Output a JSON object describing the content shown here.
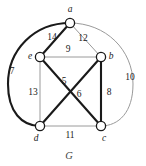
{
  "figure": {
    "caption": "G",
    "caption_position": {
      "x": 69,
      "y": 159
    },
    "background_color": "#ffffff"
  },
  "colors": {
    "thick_edge": "#1a1a1a",
    "thin_edge": "#9a9a9a",
    "node_stroke": "#1a1a1a",
    "node_fill": "#ffffff",
    "text": "#1a1a1a",
    "caption": "#444444"
  },
  "chart_data": {
    "type": "diagram",
    "subtype": "weighted-undirected-graph",
    "title": "G",
    "nodes": [
      {
        "id": "a",
        "label": "a",
        "x": 70,
        "y": 23,
        "label_x": 70,
        "label_y": 12
      },
      {
        "id": "b",
        "label": "b",
        "x": 101,
        "y": 57,
        "label_x": 111,
        "label_y": 59
      },
      {
        "id": "c",
        "label": "c",
        "x": 101,
        "y": 126,
        "label_x": 104,
        "label_y": 141
      },
      {
        "id": "d",
        "label": "d",
        "x": 40,
        "y": 126,
        "label_x": 36,
        "label_y": 141
      },
      {
        "id": "e",
        "label": "e",
        "x": 40,
        "y": 57,
        "label_x": 30,
        "label_y": 59
      }
    ],
    "edges": [
      {
        "id": "edge-a-e",
        "source": "a",
        "target": "e",
        "weight": 14,
        "weight_label": "14",
        "style": "thick",
        "shape": "line",
        "label_x": 52,
        "label_y": 40
      },
      {
        "id": "edge-a-b",
        "source": "a",
        "target": "b",
        "weight": 12,
        "weight_label": "12",
        "style": "thin",
        "shape": "line",
        "label_x": 83,
        "label_y": 41
      },
      {
        "id": "edge-a-d",
        "source": "a",
        "target": "d",
        "weight": 7,
        "weight_label": "7",
        "style": "thick",
        "shape": "arc-left",
        "label_x": 12,
        "label_y": 74
      },
      {
        "id": "edge-a-c",
        "source": "a",
        "target": "c",
        "weight": 10,
        "weight_label": "10",
        "style": "thin",
        "shape": "arc-right",
        "label_x": 130,
        "label_y": 80
      },
      {
        "id": "edge-e-b",
        "source": "e",
        "target": "b",
        "weight": 9,
        "weight_label": "9",
        "style": "thin",
        "shape": "line",
        "label_x": 68,
        "label_y": 52
      },
      {
        "id": "edge-e-d",
        "source": "e",
        "target": "d",
        "weight": 13,
        "weight_label": "13",
        "style": "thin",
        "shape": "line",
        "label_x": 33,
        "label_y": 95
      },
      {
        "id": "edge-b-c",
        "source": "b",
        "target": "c",
        "weight": 8,
        "weight_label": "8",
        "style": "thick",
        "shape": "line",
        "label_x": 109,
        "label_y": 95
      },
      {
        "id": "edge-d-c",
        "source": "d",
        "target": "c",
        "weight": 11,
        "weight_label": "11",
        "style": "thin",
        "shape": "line",
        "label_x": 70,
        "label_y": 138
      },
      {
        "id": "edge-e-c",
        "source": "e",
        "target": "c",
        "weight": 5,
        "weight_label": "5",
        "style": "thick",
        "shape": "line",
        "label_x": 64,
        "label_y": 84
      },
      {
        "id": "edge-b-d",
        "source": "b",
        "target": "d",
        "weight": 6,
        "weight_label": "6",
        "style": "thick",
        "shape": "line",
        "label_x": 79,
        "label_y": 97
      }
    ],
    "node_radius": 4.6,
    "arc_left_path": "M 70 23 C 34 23, 8 50, 8 84 C 8 112, 22 126, 40 126",
    "arc_right_path": "M 70 23 C 106 23, 133 50, 133 84 C 133 112, 119 126, 101 126"
  }
}
